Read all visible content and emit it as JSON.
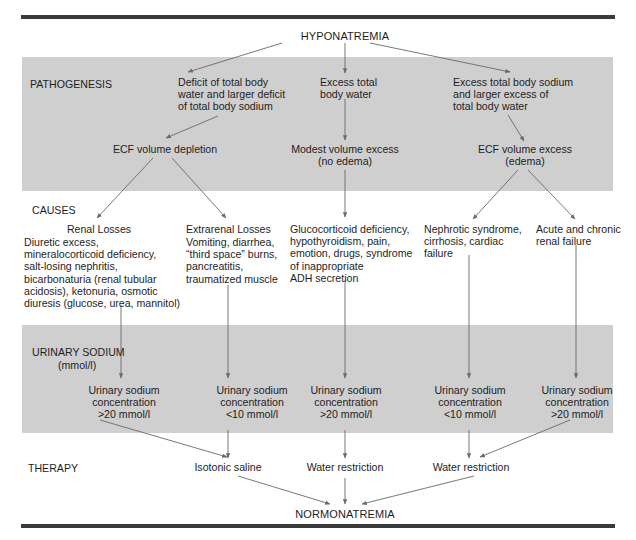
{
  "title": "HYPONATREMIA",
  "outcome": "NORMONATREMIA",
  "colors": {
    "band": "#cfcfcf",
    "rule": "#3a3a3a",
    "arrow": "#6a6a6a",
    "text": "#1e1e1e"
  },
  "sections": {
    "pathogenesis": "PATHOGENESIS",
    "causes": "CAUSES",
    "urinary_sodium": "URINARY SODIUM",
    "urinary_sodium_unit": "(mmol/l)",
    "therapy": "THERAPY"
  },
  "pathogenesis": {
    "left": "Deficit of total body\nwater and larger deficit\nof total body sodium",
    "middle": "Excess total\nbody water",
    "right": "Excess total body sodium\nand larger excess of\ntotal body water"
  },
  "volume_state": {
    "left": "ECF volume depletion",
    "middle": "Modest volume excess\n(no edema)",
    "right": "ECF volume excess\n(edema)"
  },
  "causes": [
    {
      "heading": "Renal Losses",
      "text": "Diuretic excess,\nmineralocorticoid deficiency,\nsalt-losing nephritis,\nbicarbonaturia (renal tubular\nacidosis), ketonuria, osmotic\ndiuresis (glucose, urea, mannitol)"
    },
    {
      "heading": "Extrarenal Losses",
      "text": "Vomiting, diarrhea,\n“third space” burns,\npancreatitis,\ntraumatized muscle"
    },
    {
      "heading": "",
      "text": "Glucocorticoid deficiency,\nhypothyroidism, pain,\nemotion, drugs, syndrome\nof inappropriate\nADH secretion"
    },
    {
      "heading": "",
      "text": "Nephrotic syndrome,\ncirrhosis, cardiac\nfailure"
    },
    {
      "heading": "",
      "text": "Acute and chronic\nrenal failure"
    }
  ],
  "urinary": [
    {
      "text": "Urinary sodium\nconcentration\n>20 mmol/l"
    },
    {
      "text": "Urinary sodium\nconcentration\n<10 mmol/l"
    },
    {
      "text": "Urinary sodium\nconcentration\n>20 mmol/l"
    },
    {
      "text": "Urinary sodium\nconcentration\n<10 mmol/l"
    },
    {
      "text": "Urinary sodium\nconcentration\n>20 mmol/l"
    }
  ],
  "therapy": [
    {
      "text": "Isotonic saline"
    },
    {
      "text": "Water restriction"
    },
    {
      "text": "Water restriction"
    }
  ]
}
